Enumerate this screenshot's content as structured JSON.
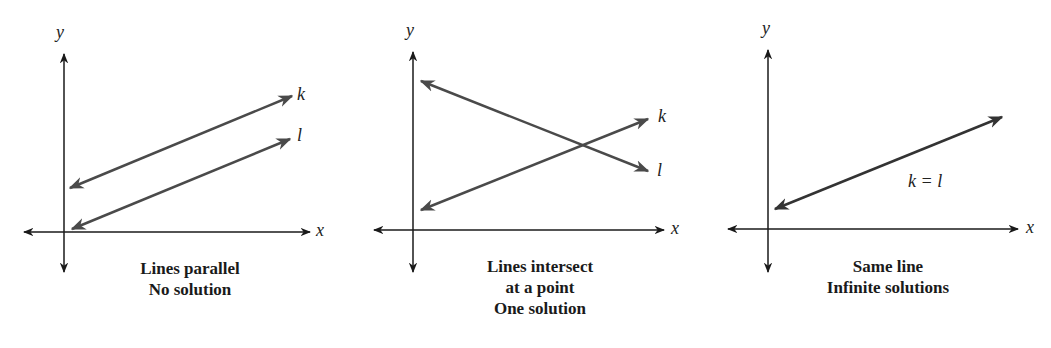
{
  "figure": {
    "panels": [
      {
        "id": "parallel",
        "axis_labels": {
          "x": "x",
          "y": "y"
        },
        "line_labels": [
          "k",
          "l"
        ],
        "caption_lines": [
          "Lines parallel",
          "No solution"
        ]
      },
      {
        "id": "intersect",
        "axis_labels": {
          "x": "x",
          "y": "y"
        },
        "line_labels": [
          "k",
          "l"
        ],
        "caption_lines": [
          "Lines intersect",
          "at a point",
          "One solution"
        ]
      },
      {
        "id": "same",
        "axis_labels": {
          "x": "x",
          "y": "y"
        },
        "line_labels": [
          "k = l"
        ],
        "caption_lines": [
          "Same line",
          "Infinite solutions"
        ]
      }
    ],
    "colors": {
      "axis": "#1a1a1a",
      "line": "#4a4a4a",
      "background": "#ffffff"
    }
  }
}
